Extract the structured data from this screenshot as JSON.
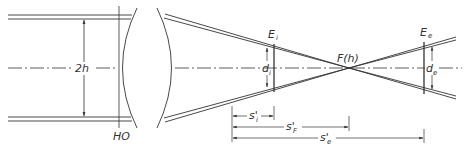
{
  "diagram": {
    "type": "optical ray diagram",
    "labels": {
      "beam_height": "2h",
      "principal_plane": "HO",
      "plane_i": "E",
      "plane_i_sub": "i",
      "plane_e": "E",
      "plane_e_sub": "e",
      "focus": "F(h)",
      "diam_i": "d",
      "diam_i_sub": "i",
      "diam_e": "d",
      "diam_e_sub": "e",
      "dist_i": "s'",
      "dist_i_sub": "i",
      "dist_F": "s'",
      "dist_F_sub": "F",
      "dist_e": "s'",
      "dist_e_sub": "e"
    },
    "colors": {
      "stroke": "#333333",
      "background": "#ffffff"
    }
  }
}
